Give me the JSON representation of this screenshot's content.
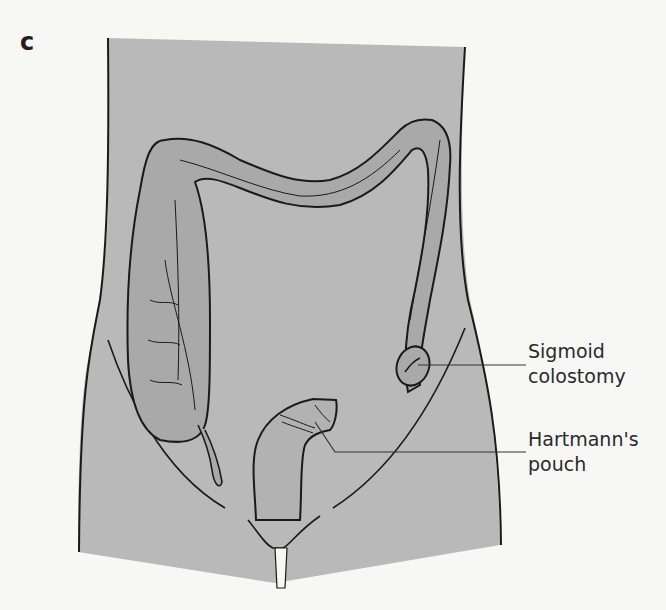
{
  "panel": {
    "letter": "c"
  },
  "colors": {
    "background": "#f7f7f5",
    "body_fill": "#b9b9b9",
    "colon_fill": "#a9a9a9",
    "outline": "#1a1a1a",
    "leader_line": "#333333",
    "label_text": "#2b2b2b"
  },
  "labels": [
    {
      "id": "sigmoid-colostomy",
      "lines": [
        "Sigmoid",
        "colostomy"
      ]
    },
    {
      "id": "hartmanns-pouch",
      "lines": [
        "Hartmann's",
        "pouch"
      ]
    }
  ],
  "structures": [
    "abdomen-outline",
    "ascending-colon",
    "cecum",
    "appendix",
    "transverse-colon",
    "descending-colon",
    "sigmoid-colostomy-stoma",
    "hartmanns-pouch-rectal-stump",
    "inguinal-lines",
    "pubic-region"
  ]
}
